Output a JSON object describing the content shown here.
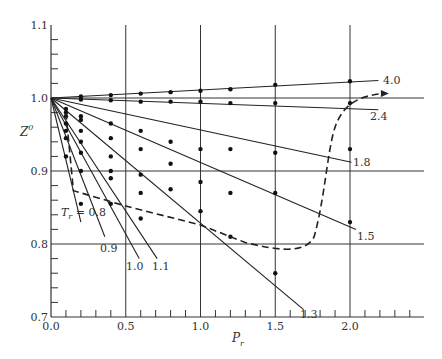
{
  "chart_data": {
    "type": "line",
    "title": "",
    "xlabel": "P_r",
    "ylabel": "Z^0",
    "xlim": [
      0.0,
      2.5
    ],
    "ylim": [
      0.7,
      1.1
    ],
    "xticks": [
      "0.0",
      "0.5",
      "1.0",
      "1.5",
      "2.0"
    ],
    "yticks": [
      "0.7",
      "0.8",
      "0.9",
      "1.0",
      "1.1"
    ],
    "grid": {
      "vertical": [
        0.5,
        1.0,
        1.5,
        2.0
      ],
      "horizontal": [
        0.8,
        0.9,
        1.0
      ]
    },
    "legend_prefix": "T_r =",
    "series": [
      {
        "name": "0.8",
        "style": "solid",
        "x": [
          0.0,
          0.2
        ],
        "y": [
          1.0,
          0.83
        ],
        "points": [
          [
            0.1,
            0.92
          ],
          [
            0.2,
            0.855
          ]
        ]
      },
      {
        "name": "0.9",
        "style": "solid",
        "x": [
          0.0,
          0.36
        ],
        "y": [
          1.0,
          0.81
        ],
        "points": [
          [
            0.1,
            0.945
          ],
          [
            0.2,
            0.9
          ],
          [
            0.4,
            0.855
          ]
        ]
      },
      {
        "name": "1.0",
        "style": "solid",
        "x": [
          0.0,
          0.59
        ],
        "y": [
          1.0,
          0.78
        ],
        "points": [
          [
            0.1,
            0.955
          ],
          [
            0.2,
            0.925
          ],
          [
            0.4,
            0.89
          ],
          [
            0.6,
            0.835
          ]
        ]
      },
      {
        "name": "1.1",
        "style": "solid",
        "x": [
          0.0,
          0.71
        ],
        "y": [
          1.0,
          0.78
        ],
        "points": [
          [
            0.1,
            0.965
          ],
          [
            0.2,
            0.94
          ],
          [
            0.4,
            0.9
          ],
          [
            0.6,
            0.87
          ]
        ]
      },
      {
        "name": "1.3",
        "style": "solid",
        "x": [
          0.0,
          1.69
        ],
        "y": [
          1.0,
          0.71
        ],
        "points": [
          [
            0.1,
            0.975
          ],
          [
            0.2,
            0.955
          ],
          [
            0.4,
            0.92
          ],
          [
            0.6,
            0.895
          ],
          [
            0.8,
            0.875
          ],
          [
            1.0,
            0.845
          ],
          [
            1.2,
            0.81
          ],
          [
            1.5,
            0.76
          ]
        ]
      },
      {
        "name": "1.5",
        "style": "solid",
        "x": [
          0.0,
          2.04
        ],
        "y": [
          1.0,
          0.82
        ],
        "points": [
          [
            0.1,
            0.98
          ],
          [
            0.2,
            0.97
          ],
          [
            0.4,
            0.945
          ],
          [
            0.6,
            0.93
          ],
          [
            0.8,
            0.91
          ],
          [
            1.0,
            0.885
          ],
          [
            1.2,
            0.87
          ],
          [
            1.5,
            0.87
          ],
          [
            2.0,
            0.83
          ]
        ]
      },
      {
        "name": "1.8",
        "style": "solid",
        "x": [
          0.0,
          2.01
        ],
        "y": [
          1.0,
          0.912
        ],
        "points": [
          [
            0.1,
            0.985
          ],
          [
            0.2,
            0.975
          ],
          [
            0.4,
            0.965
          ],
          [
            0.6,
            0.955
          ],
          [
            0.8,
            0.94
          ],
          [
            1.0,
            0.93
          ],
          [
            1.2,
            0.93
          ],
          [
            1.5,
            0.925
          ],
          [
            2.0,
            0.93
          ]
        ]
      },
      {
        "name": "2.4",
        "style": "solid",
        "x": [
          0.0,
          2.19
        ],
        "y": [
          1.0,
          0.984
        ],
        "points": [
          [
            0.2,
            0.998
          ],
          [
            0.4,
            0.997
          ],
          [
            0.6,
            0.995
          ],
          [
            0.8,
            0.995
          ],
          [
            1.0,
            0.995
          ],
          [
            1.2,
            0.993
          ],
          [
            1.5,
            0.993
          ],
          [
            2.0,
            0.993
          ]
        ]
      },
      {
        "name": "4.0",
        "style": "solid",
        "x": [
          0.0,
          2.19
        ],
        "y": [
          1.0,
          1.024
        ],
        "points": [
          [
            0.2,
            1.002
          ],
          [
            0.4,
            1.004
          ],
          [
            0.6,
            1.006
          ],
          [
            0.8,
            1.008
          ],
          [
            1.0,
            1.01
          ],
          [
            1.2,
            1.012
          ],
          [
            1.5,
            1.018
          ],
          [
            2.0,
            1.023
          ]
        ]
      }
    ],
    "dashed_boundary": {
      "description": "Dashed boundary curve with arrow",
      "x": [
        0.1,
        0.15,
        0.5,
        1.0,
        1.3,
        1.6,
        1.75,
        1.85,
        1.92,
        2.0,
        2.2
      ],
      "y": [
        0.98,
        0.87,
        0.85,
        0.825,
        0.8,
        0.79,
        0.8,
        0.87,
        0.96,
        0.99,
        1.005
      ]
    }
  },
  "labels": {
    "xlabel_main": "P",
    "xlabel_sub": "r",
    "ylabel_main": "Z",
    "ylabel_sup": "0",
    "tr_prefix_main": "T",
    "tr_prefix_sub": "r",
    "tr_prefix_eq": " = 0.8",
    "curve_labels": [
      "0.9",
      "1.0",
      "1.1",
      "1.3",
      "1.5",
      "1.8",
      "2.4",
      "4.0"
    ]
  }
}
